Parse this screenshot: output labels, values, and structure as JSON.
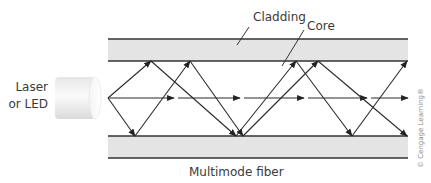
{
  "labels": {
    "cladding": "Cladding",
    "core": "Core",
    "source_line1": "Laser",
    "source_line2": "or LED",
    "caption": "Multimode fiber",
    "credit": "© Cengage Learning®"
  },
  "colors": {
    "cladding_fill": "#e4e4e4",
    "line": "#333333",
    "text": "#3a3a3a",
    "source_fill": "#f2f2f2"
  },
  "geometry": {
    "fiber_x": [
      108,
      408
    ],
    "top_cladding_y": [
      39,
      61
    ],
    "bottom_cladding_y": [
      136,
      158
    ],
    "source_point": [
      108,
      98
    ]
  }
}
